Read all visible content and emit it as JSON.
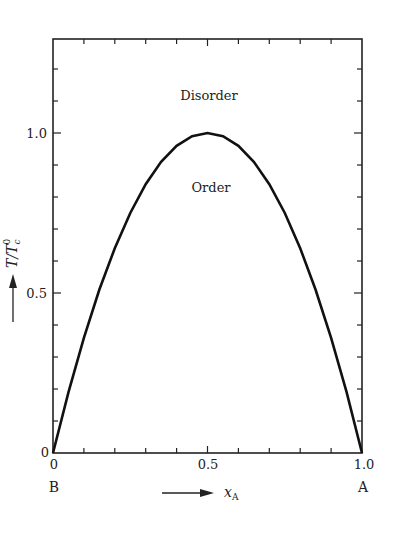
{
  "chart_data": {
    "type": "line",
    "title": "",
    "xlabel": "x_A",
    "ylabel": "T/T_c^0",
    "xlim": [
      0,
      1.0
    ],
    "ylim": [
      0,
      1.3
    ],
    "x_ticks": [
      0,
      0.5,
      1.0
    ],
    "x_tick_labels": [
      "0",
      "0.5",
      "1.0"
    ],
    "y_ticks": [
      0,
      0.5,
      1.0
    ],
    "y_tick_labels": [
      "0",
      "0.5",
      "1.0"
    ],
    "minor_tick_step_x": 0.1,
    "minor_tick_step_y": 0.1,
    "grid": false,
    "legend": null,
    "series": [
      {
        "name": "order-disorder boundary",
        "x": [
          0,
          0.05,
          0.1,
          0.15,
          0.2,
          0.25,
          0.3,
          0.35,
          0.4,
          0.45,
          0.5,
          0.55,
          0.6,
          0.65,
          0.7,
          0.75,
          0.8,
          0.85,
          0.9,
          0.95,
          1.0
        ],
        "values": [
          0,
          0.19,
          0.36,
          0.51,
          0.64,
          0.75,
          0.84,
          0.91,
          0.96,
          0.99,
          1.0,
          0.99,
          0.96,
          0.91,
          0.84,
          0.75,
          0.64,
          0.51,
          0.36,
          0.19,
          0
        ]
      }
    ],
    "annotations": [
      {
        "text": "Disorder",
        "x": 0.5,
        "y": 1.16
      },
      {
        "text": "Order",
        "x": 0.5,
        "y": 0.84
      },
      {
        "text": "B",
        "position": "below x=0"
      },
      {
        "text": "A",
        "position": "below x=1.0"
      }
    ]
  },
  "labels": {
    "disorder": "Disorder",
    "order": "Order",
    "end_left": "B",
    "end_right": "A",
    "x_axis_main": "x",
    "x_axis_sub": "A",
    "y_axis_main": "T/T",
    "y_axis_sub": "c",
    "y_axis_sup": "0",
    "x_tick_0": "0",
    "x_tick_05": "0.5",
    "x_tick_1": "1.0",
    "y_tick_0": "0",
    "y_tick_05": "0.5",
    "y_tick_1": "1.0"
  }
}
